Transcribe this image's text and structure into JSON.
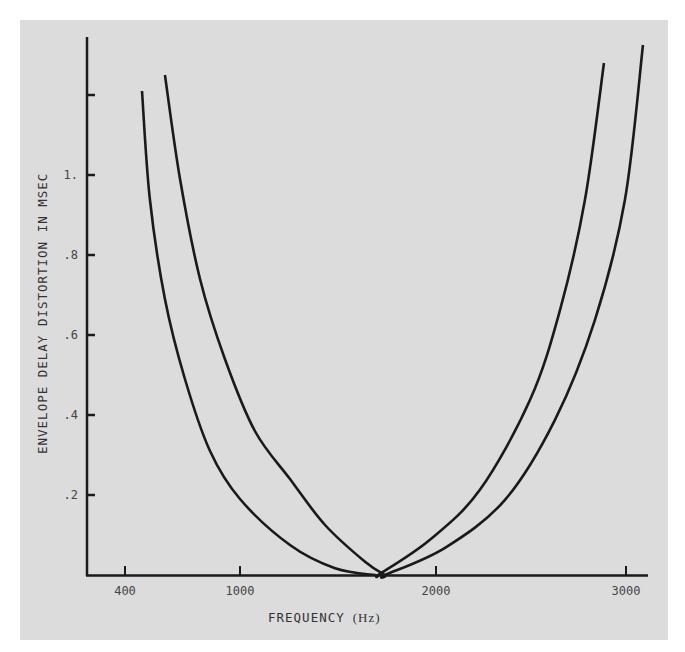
{
  "chart_data": {
    "type": "line",
    "title": "",
    "xlabel": "FREQUENCY (Hz)",
    "ylabel": "ENVELOPE DELAY DISTORTION IN MSEC",
    "xlim": [
      200,
      3100
    ],
    "ylim": [
      0,
      1.35
    ],
    "x_ticks": [
      400,
      1000,
      2000,
      3000
    ],
    "x_tick_labels": [
      "400",
      "1000",
      "2000",
      "3000"
    ],
    "y_ticks": [
      0.2,
      0.4,
      0.6,
      0.8,
      1.0,
      1.2
    ],
    "y_tick_labels": [
      ".2",
      ".4",
      ".6",
      ".8",
      "1.",
      ""
    ],
    "grid": false,
    "legend": null,
    "series": [
      {
        "name": "Curve A (inner)",
        "x": [
          500,
          540,
          617,
          719,
          847,
          1000,
          1255,
          1485,
          1689,
          1714,
          1969,
          2224,
          2480,
          2633,
          2760,
          2857
        ],
        "y": [
          1.21,
          0.94,
          0.69,
          0.49,
          0.31,
          0.19,
          0.075,
          0.017,
          0.0,
          0.003,
          0.088,
          0.213,
          0.438,
          0.663,
          0.938,
          1.28
        ]
      },
      {
        "name": "Curve B (outer)",
        "x": [
          617,
          694,
          796,
          923,
          1076,
          1255,
          1434,
          1638,
          1740,
          1740,
          2046,
          2352,
          2607,
          2811,
          2964,
          3056
        ],
        "y": [
          1.25,
          0.99,
          0.74,
          0.54,
          0.36,
          0.24,
          0.125,
          0.033,
          0.0,
          0.0,
          0.068,
          0.188,
          0.388,
          0.638,
          0.938,
          1.325
        ]
      }
    ]
  },
  "axes": {
    "x_title": "FREQUENCY",
    "x_unit": "(Hz)",
    "y_title": "ENVELOPE DELAY DISTORTION IN MSEC"
  },
  "colors": {
    "background": "#dcdcdc",
    "line": "#1a1a1a",
    "text": "#444444"
  }
}
